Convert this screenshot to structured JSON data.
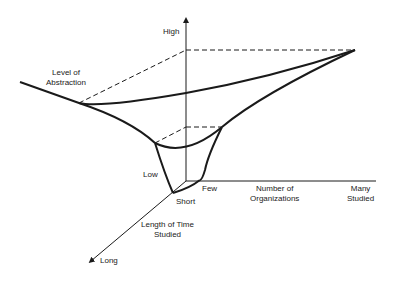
{
  "axes": {
    "vertical": {
      "title_line1": "Level of",
      "title_line2": "Abstraction",
      "high": "High",
      "low": "Low"
    },
    "horizontal": {
      "title_line1": "Number of",
      "title_line2": "Organizations",
      "few": "Few",
      "many_line1": "Many",
      "many_line2": "Studied"
    },
    "depth": {
      "title_line1": "Length of Time",
      "title_line2": "Studied",
      "short": "Short",
      "long": "Long"
    }
  },
  "colors": {
    "line": "#1a1a1a",
    "background": "#ffffff"
  }
}
